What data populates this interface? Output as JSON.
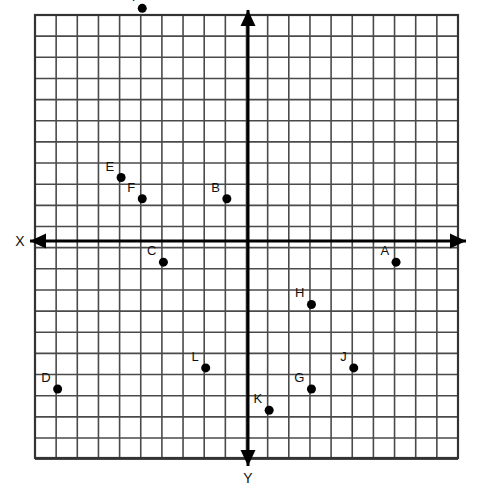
{
  "figure": {
    "title": "",
    "background_color": "#ffffff",
    "grid_color": "#4a4a4a",
    "axis_color": "#000000",
    "point_color": "#000000",
    "label_color": "#111111"
  },
  "axes": {
    "x_axis_label": "X",
    "y_axis_label": "Y",
    "x_axis_arrow_left": "◀",
    "x_axis_arrow_right": "▶",
    "y_axis_arrow_up": "▲",
    "y_axis_arrow_down": "▼"
  },
  "chart_data": {
    "type": "scatter",
    "title": "",
    "xlabel": "X",
    "ylabel": "Y",
    "grid": true,
    "legend": "none",
    "note": "Coordinate plane with unit gridlines; X axis points left-right, Y axis points up-down with positive Y downward-drawn arrow. Coordinates are in grid units relative to the origin at the axis intersection.",
    "xlim": [
      -10,
      10
    ],
    "ylim": [
      -10,
      11
    ],
    "labels": [
      "A",
      "B",
      "C",
      "D",
      "E",
      "F",
      "G",
      "H",
      "I",
      "J",
      "K",
      "L"
    ],
    "points": [
      {
        "label": "A",
        "x": 7,
        "y": -1
      },
      {
        "label": "B",
        "x": -1,
        "y": 2
      },
      {
        "label": "C",
        "x": -4,
        "y": -1
      },
      {
        "label": "D",
        "x": -9,
        "y": -7
      },
      {
        "label": "E",
        "x": -6,
        "y": 3
      },
      {
        "label": "F",
        "x": -5,
        "y": 2
      },
      {
        "label": "G",
        "x": 3,
        "y": -7
      },
      {
        "label": "H",
        "x": 3,
        "y": -3
      },
      {
        "label": "I",
        "x": -5,
        "y": 11
      },
      {
        "label": "J",
        "x": 5,
        "y": -6
      },
      {
        "label": "K",
        "x": 1,
        "y": -8
      },
      {
        "label": "L",
        "x": -2,
        "y": -6
      }
    ],
    "x": [
      7,
      -1,
      -4,
      -9,
      -6,
      -5,
      3,
      3,
      -5,
      5,
      1,
      -2
    ],
    "y": [
      -1,
      2,
      -1,
      -7,
      3,
      2,
      -7,
      -3,
      11,
      -6,
      -8,
      -6
    ]
  },
  "geometry": {
    "grid_left": 35,
    "grid_top": 15,
    "grid_right": 458,
    "grid_bottom": 458,
    "cell_size": 21.15,
    "origin_x": 248,
    "origin_y": 241,
    "point_radius": 4.5
  }
}
